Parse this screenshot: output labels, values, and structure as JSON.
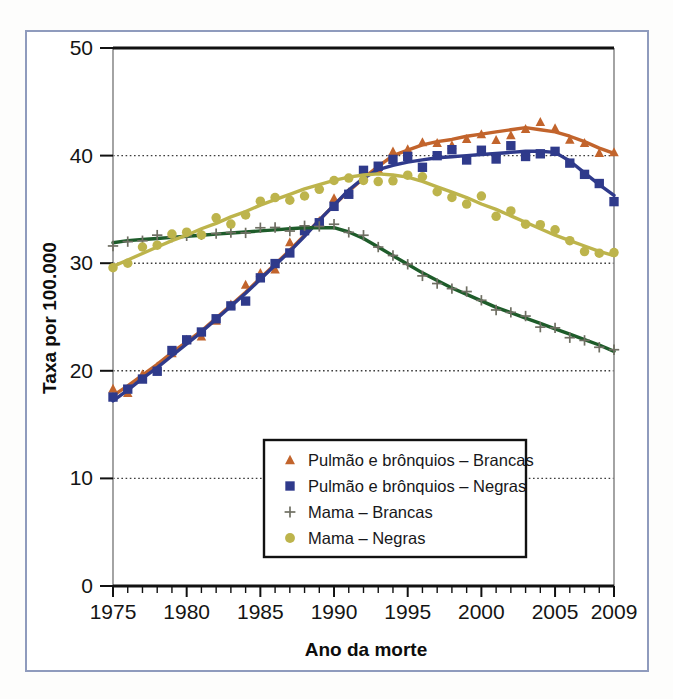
{
  "figure": {
    "background_color": "#ffffff",
    "frame_color": "#8f9bbd"
  },
  "chart_data": {
    "type": "line",
    "title": "",
    "xlabel": "Ano da morte",
    "ylabel": "Taxa por 100.000",
    "xlim": [
      1975,
      2009
    ],
    "ylim": [
      0,
      50
    ],
    "xticks": [
      1975,
      1980,
      1985,
      1990,
      1995,
      2000,
      2005,
      2009
    ],
    "yticks": [
      0,
      10,
      20,
      30,
      40,
      50
    ],
    "xtick_labels": [
      "1975",
      "1980",
      "1985",
      "1990",
      "1995",
      "2000",
      "2005",
      "2009"
    ],
    "ytick_labels": [
      "0",
      "10",
      "20",
      "30",
      "40",
      "50"
    ],
    "grid": "horizontal-dotted",
    "legend_position": "lower-center",
    "x": [
      1975,
      1976,
      1977,
      1978,
      1979,
      1980,
      1981,
      1982,
      1983,
      1984,
      1985,
      1986,
      1987,
      1988,
      1989,
      1990,
      1991,
      1992,
      1993,
      1994,
      1995,
      1996,
      1997,
      1998,
      1999,
      2000,
      2001,
      2002,
      2003,
      2004,
      2005,
      2006,
      2007,
      2008,
      2009
    ],
    "series": [
      {
        "name": "Pulmão e brônquios – Brancas",
        "color": "#c2642c",
        "marker": "triangle",
        "values": [
          17.7,
          18.6,
          19.6,
          20.6,
          21.7,
          22.7,
          23.7,
          24.9,
          26.1,
          27.3,
          28.6,
          29.9,
          31.2,
          32.6,
          34.0,
          35.4,
          36.7,
          37.9,
          39.0,
          40.0,
          40.5,
          41.0,
          41.3,
          41.5,
          41.8,
          42.0,
          42.2,
          42.4,
          42.6,
          42.4,
          42.2,
          41.8,
          41.3,
          40.7,
          40.2
        ]
      },
      {
        "name": "Pulmão e brônquios – Negras",
        "color": "#2f3a8b",
        "marker": "square",
        "values": [
          17.2,
          18.2,
          19.3,
          20.3,
          21.4,
          22.5,
          23.6,
          24.8,
          26.0,
          27.2,
          28.5,
          29.8,
          31.1,
          32.5,
          34.0,
          35.4,
          36.8,
          37.9,
          38.7,
          39.1,
          39.4,
          39.6,
          39.8,
          39.9,
          40.0,
          40.1,
          40.2,
          40.3,
          40.4,
          40.4,
          40.3,
          39.5,
          38.4,
          37.3,
          36.3
        ]
      },
      {
        "name": "Mama – Brancas",
        "color": "#1e5c2a",
        "marker": "plus",
        "values": [
          31.9,
          32.1,
          32.2,
          32.3,
          32.4,
          32.5,
          32.6,
          32.7,
          32.8,
          32.9,
          33.0,
          33.1,
          33.2,
          33.3,
          33.3,
          33.3,
          32.9,
          32.3,
          31.5,
          30.7,
          29.9,
          29.1,
          28.4,
          27.7,
          27.1,
          26.5,
          25.9,
          25.4,
          24.9,
          24.4,
          23.9,
          23.4,
          22.9,
          22.4,
          21.8
        ]
      },
      {
        "name": "Mama – Negras",
        "color": "#bdb44c",
        "marker": "circle",
        "values": [
          29.7,
          30.3,
          30.9,
          31.5,
          32.1,
          32.6,
          33.2,
          33.7,
          34.3,
          34.8,
          35.4,
          35.9,
          36.4,
          36.9,
          37.3,
          37.7,
          38.0,
          38.2,
          38.3,
          38.2,
          38.0,
          37.6,
          37.1,
          36.6,
          36.1,
          35.5,
          35.0,
          34.4,
          33.8,
          33.2,
          32.6,
          32.1,
          31.6,
          31.1,
          30.7
        ]
      }
    ]
  },
  "legend": {
    "items": [
      {
        "label": "Pulmão e brônquios – Brancas",
        "marker": "triangle",
        "color": "#c2642c"
      },
      {
        "label": "Pulmão e brônquios – Negras",
        "marker": "square",
        "color": "#2f3a8b"
      },
      {
        "label": "Mama – Brancas",
        "marker": "plus",
        "color": "#6f6f63"
      },
      {
        "label": "Mama – Negras",
        "marker": "circle",
        "color": "#bdb44c"
      }
    ]
  }
}
